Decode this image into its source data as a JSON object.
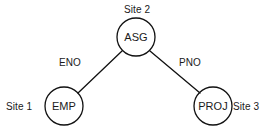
{
  "diagram": {
    "type": "join-graph",
    "background_color": "#ffffff",
    "stroke_color": "#111111",
    "text_color": "#1a1a1a",
    "nodes": [
      {
        "id": "emp",
        "label": "EMP",
        "site_label": "Site 1",
        "site_label_position": "left",
        "cx": 64,
        "cy": 106,
        "r": 19
      },
      {
        "id": "asg",
        "label": "ASG",
        "site_label": "Site 2",
        "site_label_position": "top",
        "cx": 136,
        "cy": 37,
        "r": 19
      },
      {
        "id": "proj",
        "label": "PROJ",
        "site_label": "Site 3",
        "site_label_position": "right",
        "cx": 213,
        "cy": 106,
        "r": 19
      }
    ],
    "edges": [
      {
        "id": "eno",
        "label": "ENO",
        "from": "asg",
        "to": "emp",
        "x1": 122,
        "y1": 51,
        "x2": 78,
        "y2": 93,
        "label_x": 70,
        "label_y": 62
      },
      {
        "id": "pno",
        "label": "PNO",
        "from": "asg",
        "to": "proj",
        "x1": 150,
        "y1": 51,
        "x2": 200,
        "y2": 93,
        "label_x": 190,
        "label_y": 62
      }
    ],
    "site_label_positions": {
      "site1": {
        "x": 6,
        "y": 110
      },
      "site2": {
        "x": 124,
        "y": 13
      },
      "site3": {
        "x": 233,
        "y": 110
      }
    }
  }
}
